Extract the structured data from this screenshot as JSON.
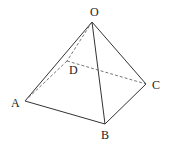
{
  "diagram": {
    "stroke_color": "#333333",
    "background": "#ffffff",
    "vertices": {
      "O": {
        "label": "O",
        "x": 92,
        "y": 22,
        "lx": 90,
        "ly": 16
      },
      "A": {
        "label": "A",
        "x": 25,
        "y": 101,
        "lx": 11,
        "ly": 107
      },
      "B": {
        "label": "B",
        "x": 105,
        "y": 124,
        "lx": 101,
        "ly": 139
      },
      "C": {
        "label": "C",
        "x": 146,
        "y": 84,
        "lx": 152,
        "ly": 89
      },
      "D": {
        "label": "D",
        "x": 67,
        "y": 61,
        "lx": 69,
        "ly": 74
      }
    },
    "solid_edges": [
      [
        "O",
        "A"
      ],
      [
        "O",
        "B"
      ],
      [
        "O",
        "C"
      ],
      [
        "A",
        "B"
      ],
      [
        "B",
        "C"
      ]
    ],
    "dashed_edges": [
      [
        "O",
        "D"
      ],
      [
        "A",
        "D"
      ],
      [
        "D",
        "C"
      ]
    ]
  }
}
